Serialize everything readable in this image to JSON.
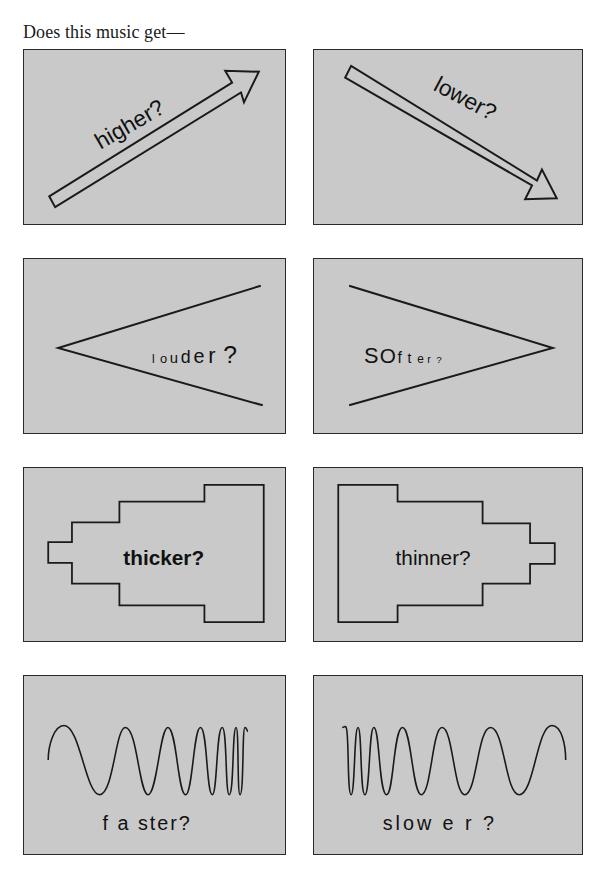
{
  "heading": "Does this music get—",
  "colors": {
    "panel_fill": "#c9c9c9",
    "stroke": "#1a1a1a",
    "background": "#ffffff"
  },
  "panels": [
    {
      "id": "higher",
      "label": "higher?",
      "shape": "arrow-up-right-icon"
    },
    {
      "id": "lower",
      "label": "lower?",
      "shape": "arrow-down-right-icon"
    },
    {
      "id": "louder",
      "label_parts": [
        "l",
        "o",
        "u",
        "d",
        "e",
        "r",
        "?"
      ],
      "label": "louder?",
      "shape": "crescendo-wedge-icon"
    },
    {
      "id": "softer",
      "label_parts": [
        "S",
        "O",
        "f",
        "t",
        "e",
        "r",
        "?"
      ],
      "label": "SOfter?",
      "shape": "decrescendo-wedge-icon"
    },
    {
      "id": "thicker",
      "label": "thicker?",
      "shape": "widening-staircase-icon"
    },
    {
      "id": "thinner",
      "label": "thinner?",
      "shape": "narrowing-staircase-icon"
    },
    {
      "id": "faster",
      "label": "f a ster?",
      "shape": "accelerating-wave-icon"
    },
    {
      "id": "slower",
      "label": "slow e r ?",
      "shape": "decelerating-wave-icon"
    }
  ]
}
